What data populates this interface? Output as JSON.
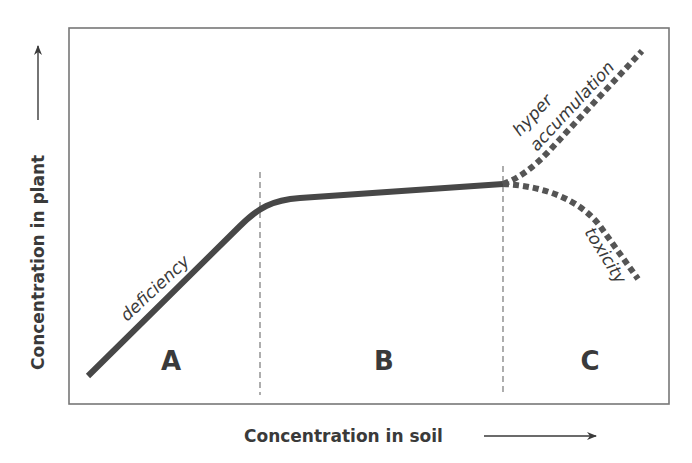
{
  "title": "",
  "axes": {
    "x_label": "Concentration in soil",
    "y_label": "Concentration in plant"
  },
  "regions": [
    {
      "id": "A",
      "label": "A"
    },
    {
      "id": "B",
      "label": "B"
    },
    {
      "id": "C",
      "label": "C"
    }
  ],
  "curve_labels": {
    "deficiency": "deficiency",
    "hyper_line1": "hyper",
    "hyper_line2": "accumulation",
    "toxicity": "toxicity"
  },
  "colors": {
    "curve": "#474747",
    "frame": "#777777",
    "divider": "#9a9a9a",
    "text": "#3a3a3a"
  }
}
